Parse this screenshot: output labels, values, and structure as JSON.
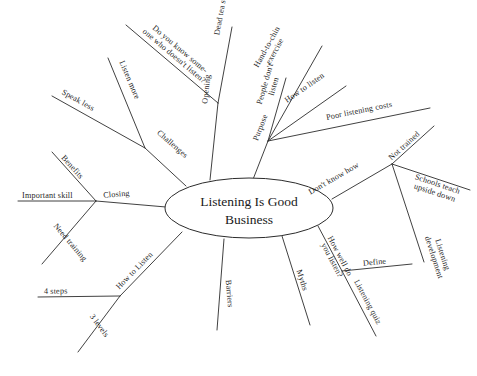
{
  "diagram": {
    "type": "mind-map",
    "background_color": "#ffffff",
    "line_color": "#2b2b2b",
    "text_color": "#1f1f1f",
    "center": {
      "label_line1": "Listening Is Good",
      "label_line2": "Business",
      "full_label": "Listening Is Good Business"
    },
    "branches": [
      {
        "id": "challenges",
        "label": "Challenges",
        "children": [
          {
            "id": "speak-less",
            "label": "Speak less"
          },
          {
            "id": "listen-more",
            "label": "Listen more"
          }
        ]
      },
      {
        "id": "opening",
        "label": "Opening",
        "children": [
          {
            "id": "do-you-know",
            "label_line1": "Do you know some-",
            "label_line2": "one who doesn't listen?",
            "label": "Do you know some-one who doesn't listen?"
          },
          {
            "id": "dead-tea-story",
            "label": "Dead tea story"
          }
        ]
      },
      {
        "id": "purpose",
        "label": "Purpose",
        "children": [
          {
            "id": "hand-to-chin",
            "label_line1": "Hand-to-chin",
            "label_line2": "exercise",
            "label": "Hand-to-chin exercise"
          },
          {
            "id": "people-dont-listen",
            "label_line1": "People don't",
            "label_line2": "listen",
            "label": "People don't listen"
          },
          {
            "id": "how-to-listen-purpose",
            "label": "How to listen"
          },
          {
            "id": "poor-listening-costs",
            "label": "Poor listening costs"
          }
        ]
      },
      {
        "id": "dont-know-how",
        "label": "Don't know how",
        "children": [
          {
            "id": "not-trained",
            "label": "Not trained"
          },
          {
            "id": "schools-teach",
            "label_line1": "Schools teach",
            "label_line2": "upside down",
            "label": "Schools teach upside down"
          },
          {
            "id": "listening-development",
            "label_line1": "Listening",
            "label_line2": "development",
            "label": "Listening development"
          }
        ]
      },
      {
        "id": "how-well-do-you-listen",
        "label_line1": "How well do",
        "label_line2": "you listen?",
        "label": "How well do you listen?",
        "children": [
          {
            "id": "define",
            "label": "Define"
          },
          {
            "id": "listening-quiz",
            "label": "Listening quiz"
          }
        ]
      },
      {
        "id": "myths",
        "label": "Myths",
        "children": []
      },
      {
        "id": "barriers",
        "label": "Barriers",
        "children": []
      },
      {
        "id": "how-to-listen",
        "label": "How to Listen",
        "children": [
          {
            "id": "four-steps",
            "label": "4 steps"
          },
          {
            "id": "three-levels",
            "label": "3 levels"
          }
        ]
      },
      {
        "id": "closing",
        "label": "Closing",
        "children": [
          {
            "id": "benefits",
            "label": "Benefits"
          },
          {
            "id": "important-skill",
            "label": "Important skill"
          },
          {
            "id": "need-training",
            "label": "Need training"
          }
        ]
      }
    ]
  }
}
